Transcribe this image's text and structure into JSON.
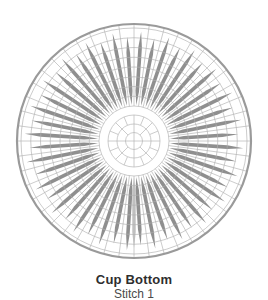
{
  "caption": {
    "title": "Cup Bottom",
    "subtitle": "Stitch 1"
  },
  "colors": {
    "background": "#ffffff",
    "outer_circle": "#9a9a9a",
    "grid": "#b0b0b0",
    "spoke": "#8f8f8f",
    "highlight_spoke": "#c7c7c7",
    "title_text": "#2e2e2e",
    "subtitle_text": "#4a4a4a"
  },
  "diagram": {
    "type": "radial-stitch-chart",
    "center": {
      "x": 134,
      "y": 141
    },
    "outer_radius": 117,
    "outer_stroke_width": 2.2,
    "grid_stroke_width": 0.65,
    "inner_rings": [
      8.5,
      17,
      26
    ],
    "grid_rings": [
      35,
      44.75,
      54.5,
      64.25,
      74,
      83.75,
      93.5,
      103.25,
      113
    ],
    "radial_lines": {
      "count": 48,
      "step_deg": 7.5,
      "start_deg": 0,
      "r0": 35,
      "r1": 117
    },
    "center_divisions": [
      {
        "count": 4,
        "start_deg": 0,
        "step_deg": 90,
        "r0": 0,
        "r1": 26
      },
      {
        "count": 4,
        "start_deg": 45,
        "step_deg": 90,
        "r0": 8.5,
        "r1": 26
      },
      {
        "count": 8,
        "start_deg": 22.5,
        "step_deg": 45,
        "r0": 17,
        "r1": 26
      }
    ],
    "spokes": {
      "count": 48,
      "start_deg": 3.75,
      "step_deg": 7.5,
      "inner_radius": 36,
      "outer_radius_long": 109.5,
      "outer_radius_short": 104.5,
      "half_width": 1.8,
      "taper_in": 14,
      "taper_out": 16
    },
    "highlight_spoke": {
      "angle_deg": 180,
      "inner_radius": 36,
      "outer_radius": 107,
      "half_width": 1.8,
      "taper_in": 14,
      "taper_out": 16
    }
  }
}
